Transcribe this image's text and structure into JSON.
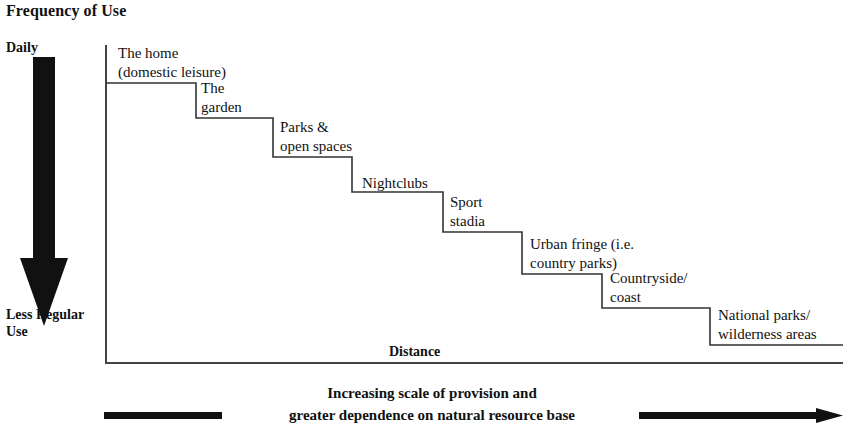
{
  "title": "Frequency of Use",
  "axes": {
    "y_top_label": "Daily",
    "y_bottom_label": "Less Regular Use",
    "x_label": "Distance"
  },
  "caption": {
    "line1": "Increasing scale of provision and",
    "line2": "greater dependence on natural resource base"
  },
  "colors": {
    "ink": "#111111",
    "line": "#333333",
    "background": "#ffffff"
  },
  "chart_data": {
    "type": "line",
    "title": "Frequency of Use",
    "xlabel": "Distance",
    "ylabel": "Frequency of Use",
    "grid": false,
    "legend": "none",
    "y_axis_ticks": [
      "Daily",
      "Less Regular Use"
    ],
    "x_axis_ticks": [],
    "categories": [
      "The home (domestic leisure)",
      "The garden",
      "Parks & open spaces",
      "Nightclubs",
      "Sport stadia",
      "Urban fringe (i.e. country parks)",
      "Countryside/ coast",
      "National parks/ wilderness areas"
    ],
    "values": [
      8,
      7,
      6,
      5,
      4,
      3,
      2,
      1
    ],
    "ylim": [
      0,
      8
    ],
    "steps": [
      {
        "index": 1,
        "label_lines": [
          "The home",
          "(domestic leisure)"
        ],
        "x_start": 106,
        "x_end": 196,
        "y": 83,
        "label_x": 118,
        "label_y": 44
      },
      {
        "index": 2,
        "label_lines": [
          "The",
          "garden"
        ],
        "x_start": 196,
        "x_end": 273,
        "y": 118,
        "label_x": 201,
        "label_y": 79
      },
      {
        "index": 3,
        "label_lines": [
          "Parks &",
          "open spaces"
        ],
        "x_start": 273,
        "x_end": 352,
        "y": 157,
        "label_x": 280,
        "label_y": 118
      },
      {
        "index": 4,
        "label_lines": [
          "Nightclubs"
        ],
        "x_start": 352,
        "x_end": 443,
        "y": 192,
        "label_x": 362,
        "label_y": 174
      },
      {
        "index": 5,
        "label_lines": [
          "Sport",
          "stadia"
        ],
        "x_start": 443,
        "x_end": 522,
        "y": 232,
        "label_x": 450,
        "label_y": 193
      },
      {
        "index": 6,
        "label_lines": [
          "Urban fringe (i.e.",
          "country parks)"
        ],
        "x_start": 522,
        "x_end": 602,
        "y": 274,
        "label_x": 530,
        "label_y": 235
      },
      {
        "index": 7,
        "label_lines": [
          "Countryside/",
          "coast"
        ],
        "x_start": 602,
        "x_end": 710,
        "y": 308,
        "label_x": 610,
        "label_y": 269
      },
      {
        "index": 8,
        "label_lines": [
          "National parks/",
          "wilderness areas"
        ],
        "x_start": 710,
        "x_end": 843,
        "y": 345,
        "label_x": 718,
        "label_y": 306
      }
    ]
  }
}
